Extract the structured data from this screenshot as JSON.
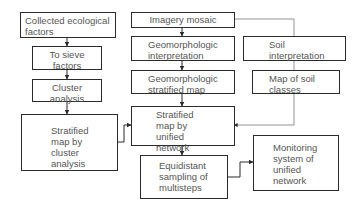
{
  "diagram": {
    "type": "flowchart",
    "nodes": [
      {
        "id": "collected",
        "label": "Collected ecological factors"
      },
      {
        "id": "sieve",
        "label": "To sieve factors"
      },
      {
        "id": "cluster",
        "label": "Cluster analysis"
      },
      {
        "id": "strat_cluster",
        "label": "Stratified map by cluster analysis"
      },
      {
        "id": "imagery",
        "label": "Imagery mosaic"
      },
      {
        "id": "geo_interp",
        "label": "Geomorphologic interpretation"
      },
      {
        "id": "geo_strat",
        "label": "Geomorphologic stratified map"
      },
      {
        "id": "strat_unified",
        "label": "Stratified map by unified network"
      },
      {
        "id": "equidistant",
        "label": "Equidistant sampling of multisteps"
      },
      {
        "id": "soil_interp",
        "label": "Soil interpretation"
      },
      {
        "id": "soil_map",
        "label": "Map of soil classes"
      },
      {
        "id": "monitoring",
        "label": "Monitoring system of unified network"
      }
    ],
    "edges": [
      {
        "from": "collected",
        "to": "sieve"
      },
      {
        "from": "sieve",
        "to": "cluster"
      },
      {
        "from": "cluster",
        "to": "strat_cluster"
      },
      {
        "from": "strat_cluster",
        "to": "strat_unified"
      },
      {
        "from": "imagery",
        "to": "geo_interp"
      },
      {
        "from": "geo_interp",
        "to": "geo_strat"
      },
      {
        "from": "geo_strat",
        "to": "strat_unified"
      },
      {
        "from": "imagery",
        "to": "soil_interp"
      },
      {
        "from": "soil_interp",
        "to": "soil_map"
      },
      {
        "from": "soil_map",
        "to": "strat_unified"
      },
      {
        "from": "strat_unified",
        "to": "equidistant"
      },
      {
        "from": "equidistant",
        "to": "monitoring"
      }
    ]
  },
  "labels": {
    "collected": "Collected ecological factors",
    "sieve": "To sieve factors",
    "cluster": "Cluster analysis",
    "strat_cluster": "Stratified map by cluster analysis",
    "imagery": "Imagery mosaic",
    "geo_interp": "Geomorphologic interpretation",
    "geo_strat": "Geomorphologic stratified map",
    "strat_unified": "Stratified map by unified network",
    "equidistant": "Equidistant sampling of multisteps",
    "soil_interp": "Soil interpretation",
    "soil_map": "Map of soil classes",
    "monitoring": "Monitoring system of unified network"
  }
}
